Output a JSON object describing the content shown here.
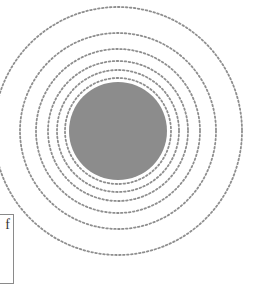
{
  "diagram": {
    "center": {
      "x": 118,
      "y": 131
    },
    "disc": {
      "radius": 49,
      "color": "#8c8c8c"
    },
    "rings": [
      {
        "radius": 53
      },
      {
        "radius": 61
      },
      {
        "radius": 70
      },
      {
        "radius": 82
      },
      {
        "radius": 98
      },
      {
        "radius": 124
      }
    ],
    "ring_color": "#8e8e8e",
    "label_box": {
      "text": "f"
    }
  }
}
